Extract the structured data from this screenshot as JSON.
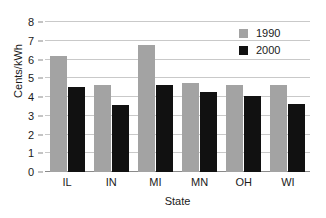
{
  "chart_data": {
    "type": "bar",
    "title": "",
    "xlabel": "State",
    "ylabel": "Cents/kWh",
    "categories": [
      "IL",
      "IN",
      "MI",
      "MN",
      "OH",
      "WI"
    ],
    "series": [
      {
        "name": "1990",
        "color": "#a3a3a3",
        "values": [
          6.2,
          4.65,
          6.75,
          4.75,
          4.65,
          4.65
        ]
      },
      {
        "name": "2000",
        "color": "#111111",
        "values": [
          4.55,
          3.55,
          4.65,
          4.25,
          4.05,
          3.65
        ]
      }
    ],
    "ylim": [
      0,
      8
    ],
    "yticks": [
      0,
      1,
      2,
      3,
      4,
      5,
      6,
      7,
      8
    ],
    "ytick_labels": [
      "0",
      "1",
      "2",
      "3",
      "4",
      "5",
      "6",
      "7",
      "8"
    ],
    "grid": true,
    "legend_position": "top-right"
  },
  "axes": {
    "y_title": "Cents/kWh",
    "x_title": "State"
  },
  "legend": {
    "entries": [
      {
        "label": "1990"
      },
      {
        "label": "2000"
      }
    ]
  },
  "colors": {
    "series_1990": "#a3a3a3",
    "series_2000": "#111111",
    "gridline": "#c9c9c9",
    "axis": "#8a8a8a",
    "text": "#1a1a1a",
    "background": "#ffffff"
  }
}
